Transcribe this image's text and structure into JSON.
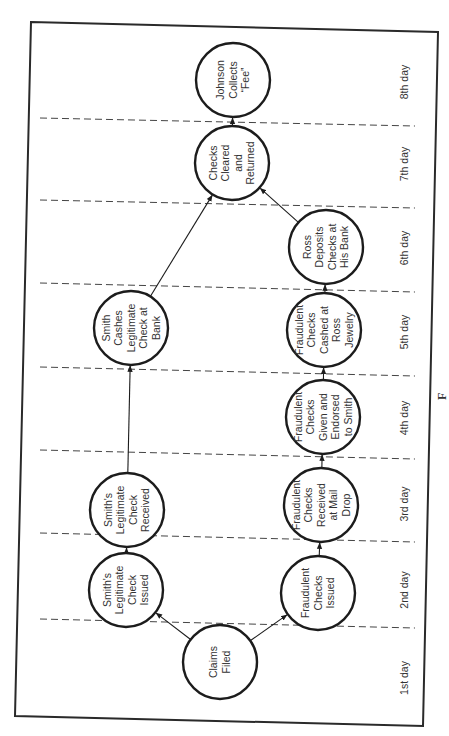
{
  "diagram": {
    "type": "timeline-network",
    "orientation": "rotated-90-ccw",
    "days": [
      "1st day",
      "2nd day",
      "3rd day",
      "4th day",
      "5th day",
      "6th day",
      "7th day",
      "8th day"
    ],
    "nodes": [
      {
        "id": "claims",
        "day": 1,
        "lines": [
          "Claims",
          "Filed"
        ]
      },
      {
        "id": "smith_issued",
        "day": 2,
        "lines": [
          "Smith's",
          "Legitimate",
          "Check",
          "Issued"
        ]
      },
      {
        "id": "fraud_issued",
        "day": 2,
        "lines": [
          "Fraudulent",
          "Checks",
          "Issued"
        ]
      },
      {
        "id": "smith_received",
        "day": 3,
        "lines": [
          "Smith's",
          "Legitimate",
          "Check",
          "Received"
        ]
      },
      {
        "id": "fraud_received",
        "day": 3,
        "lines": [
          "Fraudulent",
          "Checks",
          "Received",
          "at Mail",
          "Drop"
        ]
      },
      {
        "id": "fraud_given",
        "day": 4,
        "lines": [
          "Fraudulent",
          "Checks",
          "Given and",
          "Endorsed",
          "to Smith"
        ]
      },
      {
        "id": "smith_cashes",
        "day": 5,
        "lines": [
          "Smith",
          "Cashes",
          "Legitimate",
          "Check at",
          "Bank"
        ]
      },
      {
        "id": "fraud_cashed",
        "day": 5,
        "lines": [
          "Fraudulent",
          "Checks",
          "Cashed at",
          "Ross",
          "Jewelry"
        ]
      },
      {
        "id": "ross_deposits",
        "day": 6,
        "lines": [
          "Ross",
          "Deposits",
          "Checks at",
          "His Bank"
        ]
      },
      {
        "id": "cleared",
        "day": 7,
        "lines": [
          "Checks",
          "Cleared",
          "and",
          "Returned"
        ]
      },
      {
        "id": "johnson",
        "day": 8,
        "lines": [
          "Johnson",
          "Collects",
          "“Fee”"
        ]
      }
    ],
    "edges": [
      {
        "from": "claims",
        "to": "smith_issued"
      },
      {
        "from": "claims",
        "to": "fraud_issued"
      },
      {
        "from": "smith_issued",
        "to": "smith_received"
      },
      {
        "from": "smith_received",
        "to": "smith_cashes"
      },
      {
        "from": "smith_cashes",
        "to": "cleared"
      },
      {
        "from": "fraud_issued",
        "to": "fraud_received"
      },
      {
        "from": "fraud_received",
        "to": "fraud_given"
      },
      {
        "from": "fraud_given",
        "to": "fraud_cashed"
      },
      {
        "from": "fraud_cashed",
        "to": "ross_deposits"
      },
      {
        "from": "ross_deposits",
        "to": "cleared"
      },
      {
        "from": "cleared",
        "to": "johnson"
      }
    ],
    "caption_fragment": "F"
  }
}
